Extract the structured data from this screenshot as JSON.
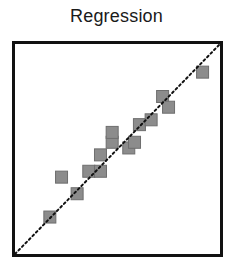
{
  "chart_data": {
    "type": "scatter",
    "title": "Regression",
    "xlabel": "",
    "ylabel": "",
    "xlim": [
      0,
      10
    ],
    "ylim": [
      0,
      10
    ],
    "grid": false,
    "legend": null,
    "axis_ticks": false,
    "reference_line": {
      "style": "dotted",
      "from": [
        0,
        0
      ],
      "to": [
        10,
        10
      ],
      "color": "#111111",
      "label": "identity (y = x)"
    },
    "marker": {
      "shape": "square",
      "color": "#8c8c8c",
      "edge_color": "#6e6e6e"
    },
    "series": [
      {
        "name": "points",
        "x": [
          1.7,
          2.27,
          3.03,
          3.6,
          4.17,
          4.17,
          4.74,
          4.74,
          5.55,
          5.83,
          6.07,
          6.64,
          7.2,
          7.49,
          9.15
        ],
        "y": [
          1.76,
          3.66,
          2.87,
          3.94,
          3.94,
          4.72,
          5.32,
          5.79,
          5.05,
          5.32,
          6.16,
          6.39,
          7.5,
          6.99,
          8.66
        ]
      }
    ]
  }
}
